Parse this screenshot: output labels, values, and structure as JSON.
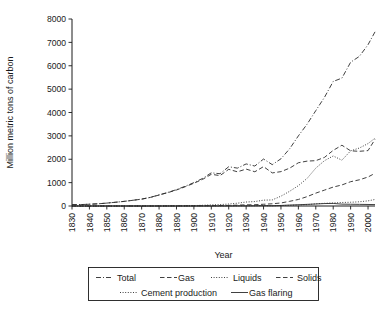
{
  "chart_data": {
    "type": "line",
    "title": "",
    "xlabel": "Year",
    "ylabel": "Million metric tons of carbon",
    "xlim": [
      1830,
      2004
    ],
    "ylim": [
      0,
      8000
    ],
    "grid": false,
    "legend_position": "bottom",
    "xticks": [
      "1830",
      "1840",
      "1850",
      "1860",
      "1870",
      "1880",
      "1890",
      "1900",
      "1910",
      "1920",
      "1930",
      "1940",
      "1950",
      "1960",
      "1970",
      "1980",
      "1990",
      "2000"
    ],
    "yticks": [
      "0",
      "1000",
      "2000",
      "3000",
      "4000",
      "5000",
      "6000",
      "7000",
      "8000"
    ],
    "x": [
      1830,
      1835,
      1840,
      1845,
      1850,
      1855,
      1860,
      1865,
      1870,
      1875,
      1880,
      1885,
      1890,
      1895,
      1900,
      1905,
      1910,
      1915,
      1920,
      1925,
      1930,
      1935,
      1940,
      1945,
      1950,
      1955,
      1960,
      1965,
      1970,
      1975,
      1980,
      1985,
      1990,
      1995,
      2000,
      2004
    ],
    "series": [
      {
        "name": "Total",
        "style": "dash-dot",
        "values": [
          54,
          60,
          76,
          94,
          124,
          160,
          198,
          245,
          295,
          370,
          475,
          580,
          700,
          845,
          1000,
          1180,
          1420,
          1380,
          1680,
          1620,
          1800,
          1710,
          2010,
          1770,
          2020,
          2450,
          3000,
          3500,
          4080,
          4650,
          5330,
          5470,
          6150,
          6400,
          6900,
          7450
        ]
      },
      {
        "name": "Gas",
        "style": "dashed",
        "values": [
          0,
          0,
          0,
          0,
          0,
          0,
          0,
          0,
          0,
          1,
          2,
          3,
          5,
          7,
          9,
          12,
          16,
          20,
          26,
          37,
          51,
          55,
          75,
          95,
          130,
          200,
          280,
          400,
          550,
          680,
          810,
          900,
          1040,
          1120,
          1240,
          1400
        ]
      },
      {
        "name": "Liquids",
        "style": "dotted",
        "values": [
          0,
          0,
          0,
          0,
          0,
          0,
          0,
          1,
          1,
          2,
          3,
          6,
          10,
          14,
          18,
          30,
          48,
          60,
          85,
          120,
          170,
          190,
          250,
          260,
          420,
          630,
          870,
          1180,
          1620,
          1940,
          2140,
          1960,
          2360,
          2480,
          2670,
          2900
        ]
      },
      {
        "name": "Solids",
        "style": "dashed",
        "values": [
          54,
          60,
          76,
          94,
          124,
          160,
          198,
          244,
          293,
          367,
          470,
          571,
          685,
          824,
          973,
          1138,
          1356,
          1300,
          1569,
          1463,
          1579,
          1465,
          1685,
          1415,
          1470,
          1620,
          1850,
          1920,
          1940,
          2080,
          2380,
          2600,
          2360,
          2340,
          2370,
          2850
        ]
      },
      {
        "name": "Cement production",
        "style": "dotted",
        "values": [
          0,
          0,
          0,
          0,
          0,
          0,
          0,
          0,
          0,
          0,
          0,
          0,
          0,
          0,
          1,
          2,
          4,
          4,
          6,
          9,
          13,
          12,
          14,
          9,
          18,
          28,
          43,
          58,
          95,
          115,
          130,
          150,
          160,
          180,
          220,
          280
        ]
      },
      {
        "name": "Gas flaring",
        "style": "solid",
        "values": [
          0,
          0,
          0,
          0,
          0,
          0,
          0,
          0,
          0,
          0,
          0,
          0,
          0,
          0,
          0,
          0,
          0,
          0,
          1,
          3,
          6,
          9,
          14,
          12,
          23,
          40,
          53,
          70,
          86,
          105,
          110,
          80,
          75,
          70,
          65,
          60
        ]
      }
    ]
  },
  "legend": {
    "items": [
      {
        "label": "Total",
        "style": "dash-dot"
      },
      {
        "label": "Gas",
        "style": "dashed"
      },
      {
        "label": "Liquids",
        "style": "dotted"
      },
      {
        "label": "Solids",
        "style": "dashed"
      },
      {
        "label": "Cement production",
        "style": "dotted"
      },
      {
        "label": "Gas flaring",
        "style": "solid"
      }
    ]
  },
  "colors": {
    "line": "#2b2b2b",
    "axis": "#1a1a1a",
    "background": "#ffffff"
  }
}
